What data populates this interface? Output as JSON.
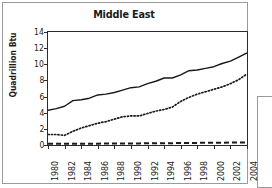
{
  "figure": {
    "title": "Middle East",
    "ylabel": "Quadrillion Btu"
  },
  "chart_data": {
    "type": "line",
    "title": "Middle East",
    "xlabel": "",
    "ylabel": "Quadrillion Btu",
    "xlim": [
      1980,
      2004
    ],
    "ylim": [
      0,
      14
    ],
    "yticks": [
      0,
      2,
      4,
      6,
      8,
      10,
      12,
      14
    ],
    "xticks": [
      1980,
      1982,
      1984,
      1986,
      1988,
      1990,
      1992,
      1994,
      1996,
      1998,
      2000,
      2002,
      2004
    ],
    "xtick_labels": [
      "1980",
      "1982",
      "1984",
      "1986",
      "1988",
      "1990",
      "1992",
      "1994",
      "1996",
      "1998",
      "2000",
      "2002",
      "2004"
    ],
    "ytick_labels": [
      "0",
      "2",
      "4",
      "6",
      "8",
      "10",
      "12",
      "14"
    ],
    "grid": false,
    "legend": "none",
    "x": [
      1980,
      1981,
      1982,
      1983,
      1984,
      1985,
      1986,
      1987,
      1988,
      1989,
      1990,
      1991,
      1992,
      1993,
      1994,
      1995,
      1996,
      1997,
      1998,
      1999,
      2000,
      2001,
      2002,
      2003,
      2004
    ],
    "series": [
      {
        "name": "series-solid",
        "style": "solid",
        "color": "#1a1a1a",
        "values": [
          4.3,
          4.5,
          4.8,
          5.5,
          5.6,
          5.8,
          6.2,
          6.3,
          6.5,
          6.8,
          7.1,
          7.2,
          7.6,
          7.9,
          8.3,
          8.3,
          8.7,
          9.2,
          9.3,
          9.5,
          9.7,
          10.1,
          10.4,
          10.9,
          11.4
        ]
      },
      {
        "name": "series-dotted",
        "style": "dotted",
        "color": "#1a1a1a",
        "values": [
          1.3,
          1.3,
          1.2,
          1.7,
          2.1,
          2.4,
          2.7,
          2.9,
          3.2,
          3.5,
          3.6,
          3.6,
          3.9,
          4.2,
          4.4,
          4.7,
          5.4,
          5.9,
          6.3,
          6.6,
          6.9,
          7.2,
          7.6,
          8.1,
          8.8
        ]
      },
      {
        "name": "series-dashed",
        "style": "dashed",
        "color": "#1a1a1a",
        "values": [
          0.15,
          0.15,
          0.15,
          0.16,
          0.16,
          0.17,
          0.17,
          0.18,
          0.18,
          0.19,
          0.2,
          0.2,
          0.21,
          0.22,
          0.22,
          0.23,
          0.24,
          0.25,
          0.26,
          0.27,
          0.28,
          0.29,
          0.3,
          0.31,
          0.33
        ]
      }
    ]
  }
}
